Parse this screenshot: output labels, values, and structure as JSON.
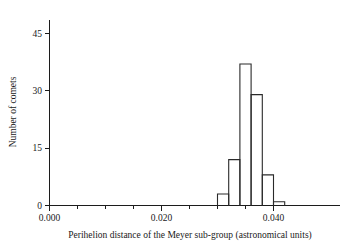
{
  "chart_data": {
    "type": "bar",
    "title": "",
    "subtitle": "",
    "xlabel": "Perihelion distance of the Meyer sub-group (astronomical units)",
    "ylabel": "Number of comets",
    "xlim": [
      0.0,
      0.0455
    ],
    "ylim": [
      0,
      50
    ],
    "grid": false,
    "legend": null,
    "bin_width": 0.002,
    "x_tick_labels": [
      "0.000",
      "0.020",
      "0.040"
    ],
    "x_tick_values": [
      0.0,
      0.02,
      0.04
    ],
    "x_minor_tick_values": [
      0.005,
      0.01,
      0.015,
      0.025,
      0.03,
      0.035
    ],
    "y_tick_labels": [
      "0",
      "15",
      "30",
      "45"
    ],
    "y_tick_values": [
      0,
      15,
      30,
      45
    ],
    "bin_edges": [
      0.03,
      0.032,
      0.034,
      0.036,
      0.038,
      0.04,
      0.042
    ],
    "categories": [
      "0.030-0.032",
      "0.032-0.034",
      "0.034-0.036",
      "0.036-0.038",
      "0.038-0.040",
      "0.040-0.042"
    ],
    "values": [
      3,
      12,
      37,
      29,
      8,
      1
    ],
    "bars": [
      {
        "x0": 0.03,
        "x1": 0.032,
        "count": 3
      },
      {
        "x0": 0.032,
        "x1": 0.034,
        "count": 12
      },
      {
        "x0": 0.034,
        "x1": 0.036,
        "count": 37
      },
      {
        "x0": 0.036,
        "x1": 0.038,
        "count": 29
      },
      {
        "x0": 0.038,
        "x1": 0.04,
        "count": 8
      },
      {
        "x0": 0.04,
        "x1": 0.042,
        "count": 1
      }
    ]
  },
  "labels": {
    "y_axis_title": "Number of comets",
    "x_axis_title": "Perihelion distance of the Meyer sub-group (astronomical units)",
    "y_tick_0": "0",
    "y_tick_15": "15",
    "y_tick_30": "30",
    "y_tick_45": "45",
    "x_tick_0": "0.000",
    "x_tick_1": "0.020",
    "x_tick_2": "0.040"
  }
}
